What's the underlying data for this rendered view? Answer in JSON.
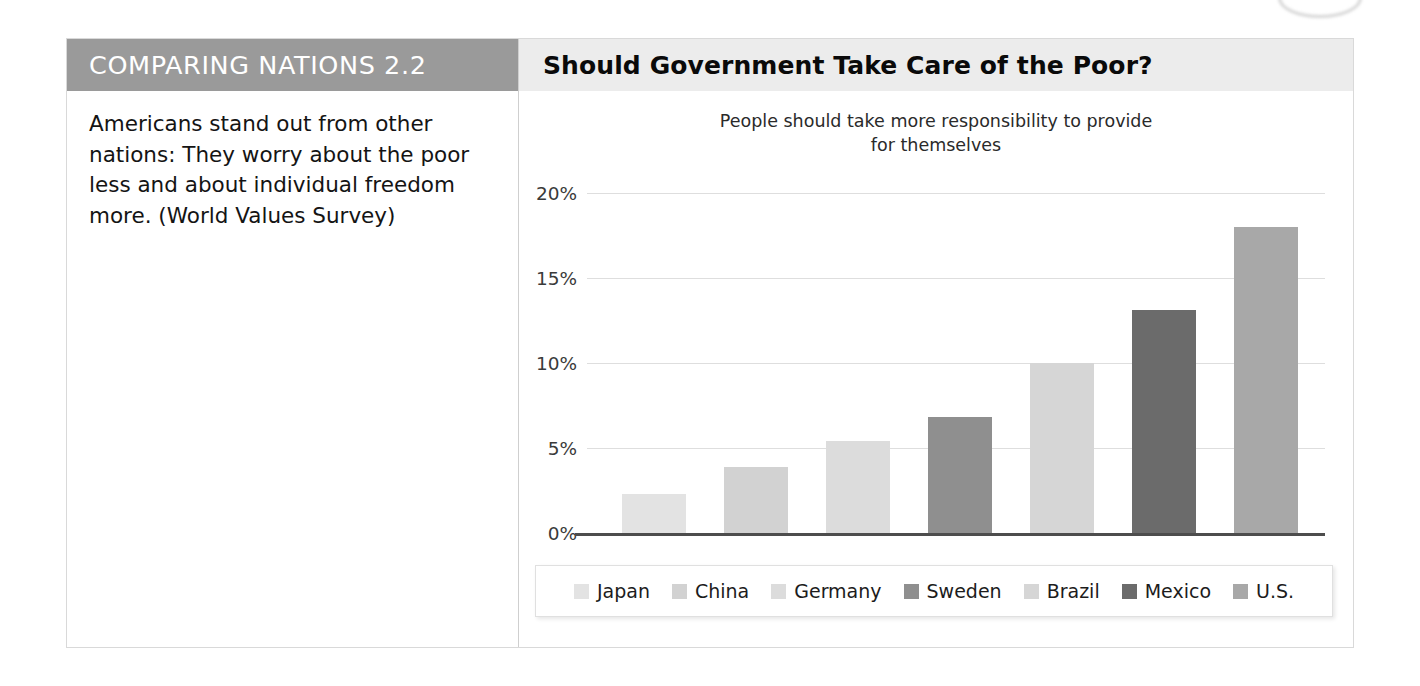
{
  "figure": {
    "label_header": "COMPARING NATIONS 2.2",
    "caption": "Americans stand out from other nations: They worry about the poor less and about individual freedom more. (World Values Survey)",
    "title": "Should Government Take Care of the Poor?"
  },
  "chart_data": {
    "type": "bar",
    "title": "People should take more responsibility to provide for themselves",
    "subtitle_line1": "People should take more responsibility to provide",
    "subtitle_line2": "for themselves",
    "categories": [
      "Japan",
      "China",
      "Germany",
      "Sweden",
      "Brazil",
      "Mexico",
      "U.S."
    ],
    "values": [
      2.3,
      3.9,
      5.4,
      6.8,
      10.0,
      13.1,
      18.0
    ],
    "colors": [
      "#e3e3e3",
      "#d2d2d2",
      "#dcdcdc",
      "#8f8f8f",
      "#d6d6d6",
      "#6b6b6b",
      "#a8a8a8"
    ],
    "xlabel": "",
    "ylabel": "",
    "ylim": [
      0,
      20
    ],
    "ytick_values": [
      0,
      5,
      10,
      15,
      20
    ],
    "ytick_labels": [
      "0%",
      "5%",
      "10%",
      "15%",
      "20%"
    ],
    "grid": true,
    "legend_position": "bottom",
    "legend": [
      {
        "label": "Japan",
        "color": "#e3e3e3"
      },
      {
        "label": "China",
        "color": "#d2d2d2"
      },
      {
        "label": "Germany",
        "color": "#dcdcdc"
      },
      {
        "label": "Sweden",
        "color": "#8f8f8f"
      },
      {
        "label": "Brazil",
        "color": "#d6d6d6"
      },
      {
        "label": "Mexico",
        "color": "#6b6b6b"
      },
      {
        "label": "U.S.",
        "color": "#a8a8a8"
      }
    ]
  },
  "theme": {
    "header_gray": "#9a9a9a",
    "title_band_gray": "#ececec",
    "gridline": "#dedede",
    "axis": "#4d4d4d"
  }
}
